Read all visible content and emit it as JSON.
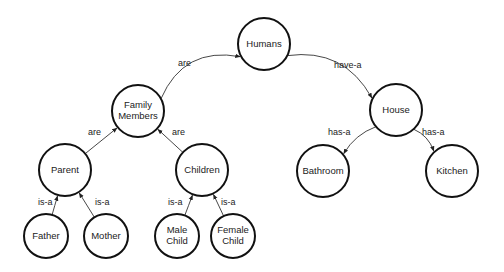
{
  "diagram": {
    "type": "semantic-network",
    "nodes": [
      {
        "id": "humans",
        "label": [
          "Humans"
        ],
        "x": 264,
        "y": 44,
        "r": 26
      },
      {
        "id": "family",
        "label": [
          "Family",
          "Members"
        ],
        "x": 138,
        "y": 111,
        "r": 26
      },
      {
        "id": "house",
        "label": [
          "House"
        ],
        "x": 396,
        "y": 110,
        "r": 26
      },
      {
        "id": "parent",
        "label": [
          "Parent"
        ],
        "x": 65,
        "y": 170,
        "r": 26
      },
      {
        "id": "children",
        "label": [
          "Children"
        ],
        "x": 202,
        "y": 170,
        "r": 26
      },
      {
        "id": "bathroom",
        "label": [
          "Bathroom"
        ],
        "x": 323,
        "y": 171,
        "r": 26
      },
      {
        "id": "kitchen",
        "label": [
          "Kitchen"
        ],
        "x": 452,
        "y": 171,
        "r": 26
      },
      {
        "id": "father",
        "label": [
          "Father"
        ],
        "x": 46,
        "y": 236,
        "r": 22
      },
      {
        "id": "mother",
        "label": [
          "Mother"
        ],
        "x": 106,
        "y": 236,
        "r": 22
      },
      {
        "id": "male",
        "label": [
          "Male",
          "Child"
        ],
        "x": 177,
        "y": 236,
        "r": 22
      },
      {
        "id": "female",
        "label": [
          "Female",
          "Child"
        ],
        "x": 233,
        "y": 236,
        "r": 22
      }
    ],
    "edges": [
      {
        "from": "family",
        "to": "humans",
        "label": "are",
        "curve": -0.25,
        "lx": 178,
        "ly": 66
      },
      {
        "from": "humans",
        "to": "house",
        "label": "have-a",
        "curve": -0.22,
        "lx": 334,
        "ly": 68
      },
      {
        "from": "parent",
        "to": "family",
        "label": "are",
        "curve": 0,
        "lx": 88,
        "ly": 135
      },
      {
        "from": "children",
        "to": "family",
        "label": "are",
        "curve": 0,
        "lx": 172,
        "ly": 135
      },
      {
        "from": "house",
        "to": "bathroom",
        "label": "has-a",
        "curve": 0.08,
        "lx": 328,
        "ly": 135
      },
      {
        "from": "house",
        "to": "kitchen",
        "label": "has-a",
        "curve": -0.08,
        "lx": 422,
        "ly": 135
      },
      {
        "from": "father",
        "to": "parent",
        "label": "is-a",
        "curve": 0,
        "lx": 38,
        "ly": 205
      },
      {
        "from": "mother",
        "to": "parent",
        "label": "is-a",
        "curve": 0,
        "lx": 95,
        "ly": 205
      },
      {
        "from": "male",
        "to": "children",
        "label": "is-a",
        "curve": 0,
        "lx": 168,
        "ly": 205
      },
      {
        "from": "female",
        "to": "children",
        "label": "is-a",
        "curve": 0,
        "lx": 221,
        "ly": 205
      }
    ]
  }
}
